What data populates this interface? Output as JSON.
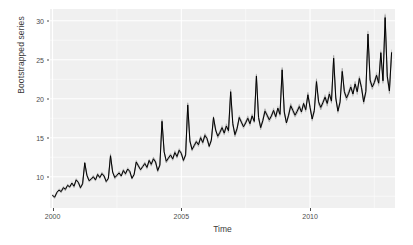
{
  "chart_data": {
    "type": "line",
    "title": "",
    "subtitle": "",
    "xlabel": "Time",
    "ylabel": "Bootstrapped series",
    "xlim": [
      1999.9,
      2013.3
    ],
    "ylim": [
      6.0,
      31.5
    ],
    "grid": true,
    "legend": "none",
    "x_ticks": [
      2000,
      2005,
      2010
    ],
    "x_tick_labels": [
      "2000",
      "2005",
      "2010"
    ],
    "y_ticks": [
      10,
      15,
      20,
      25,
      30
    ],
    "y_tick_labels": [
      "10",
      "15",
      "20",
      "25",
      "30"
    ],
    "x_minor_ticks": [
      2002.5,
      2007.5,
      2012.5
    ],
    "y_minor_ticks": [
      7.5,
      12.5,
      17.5,
      22.5,
      27.5
    ],
    "series": [
      {
        "name": "Bootstrapped series",
        "color": "#000000",
        "x": [
          2000.0,
          2000.083,
          2000.167,
          2000.25,
          2000.333,
          2000.417,
          2000.5,
          2000.583,
          2000.667,
          2000.75,
          2000.833,
          2000.917,
          2001.0,
          2001.083,
          2001.167,
          2001.25,
          2001.333,
          2001.417,
          2001.5,
          2001.583,
          2001.667,
          2001.75,
          2001.833,
          2001.917,
          2002.0,
          2002.083,
          2002.167,
          2002.25,
          2002.333,
          2002.417,
          2002.5,
          2002.583,
          2002.667,
          2002.75,
          2002.833,
          2002.917,
          2003.0,
          2003.083,
          2003.167,
          2003.25,
          2003.333,
          2003.417,
          2003.5,
          2003.583,
          2003.667,
          2003.75,
          2003.833,
          2003.917,
          2004.0,
          2004.083,
          2004.167,
          2004.25,
          2004.333,
          2004.417,
          2004.5,
          2004.583,
          2004.667,
          2004.75,
          2004.833,
          2004.917,
          2005.0,
          2005.083,
          2005.167,
          2005.25,
          2005.333,
          2005.417,
          2005.5,
          2005.583,
          2005.667,
          2005.75,
          2005.833,
          2005.917,
          2006.0,
          2006.083,
          2006.167,
          2006.25,
          2006.333,
          2006.417,
          2006.5,
          2006.583,
          2006.667,
          2006.75,
          2006.833,
          2006.917,
          2007.0,
          2007.083,
          2007.167,
          2007.25,
          2007.333,
          2007.417,
          2007.5,
          2007.583,
          2007.667,
          2007.75,
          2007.833,
          2007.917,
          2008.0,
          2008.083,
          2008.167,
          2008.25,
          2008.333,
          2008.417,
          2008.5,
          2008.583,
          2008.667,
          2008.75,
          2008.833,
          2008.917,
          2009.0,
          2009.083,
          2009.167,
          2009.25,
          2009.333,
          2009.417,
          2009.5,
          2009.583,
          2009.667,
          2009.75,
          2009.833,
          2009.917,
          2010.0,
          2010.083,
          2010.167,
          2010.25,
          2010.333,
          2010.417,
          2010.5,
          2010.583,
          2010.667,
          2010.75,
          2010.833,
          2010.917,
          2011.0,
          2011.083,
          2011.167,
          2011.25,
          2011.333,
          2011.417,
          2011.5,
          2011.583,
          2011.667,
          2011.75,
          2011.833,
          2011.917,
          2012.0,
          2012.083,
          2012.167,
          2012.25,
          2012.333,
          2012.417,
          2012.5,
          2012.583,
          2012.667,
          2012.75,
          2012.833,
          2012.917,
          2013.0,
          2013.083,
          2013.167
        ],
        "values": [
          7.6,
          7.4,
          8.0,
          8.3,
          8.1,
          8.6,
          8.4,
          8.9,
          8.7,
          9.2,
          8.8,
          9.6,
          9.3,
          8.6,
          9.1,
          11.8,
          10.2,
          9.5,
          9.7,
          10.0,
          9.6,
          10.3,
          9.9,
          10.4,
          10.1,
          9.4,
          9.8,
          12.7,
          10.6,
          9.9,
          10.2,
          10.5,
          10.1,
          10.8,
          10.4,
          11.0,
          10.7,
          9.8,
          10.3,
          11.9,
          11.4,
          10.9,
          11.3,
          11.7,
          11.2,
          12.1,
          11.6,
          12.3,
          11.9,
          10.8,
          11.5,
          17.1,
          13.2,
          12.0,
          12.4,
          12.8,
          12.3,
          13.1,
          12.6,
          13.4,
          13.0,
          12.1,
          12.8,
          19.2,
          14.6,
          13.5,
          14.0,
          14.5,
          14.1,
          15.0,
          14.4,
          15.3,
          14.9,
          13.9,
          14.7,
          17.6,
          16.0,
          15.2,
          15.7,
          16.3,
          15.6,
          16.5,
          15.9,
          20.9,
          16.8,
          15.4,
          16.2,
          17.6,
          17.0,
          16.4,
          16.9,
          17.5,
          16.8,
          17.8,
          17.1,
          22.9,
          17.6,
          16.3,
          17.2,
          18.4,
          17.9,
          17.3,
          17.8,
          18.5,
          17.7,
          18.8,
          18.0,
          23.7,
          18.3,
          16.9,
          17.9,
          19.1,
          18.5,
          17.9,
          18.4,
          19.0,
          18.3,
          19.4,
          18.6,
          20.5,
          18.9,
          17.4,
          18.5,
          22.2,
          19.6,
          18.9,
          19.5,
          20.2,
          19.4,
          20.6,
          19.7,
          25.2,
          20.1,
          18.4,
          19.6,
          23.5,
          20.9,
          20.1,
          20.7,
          21.5,
          20.6,
          21.9,
          20.9,
          22.6,
          21.4,
          19.6,
          20.9,
          28.3,
          22.4,
          21.5,
          22.1,
          23.0,
          22.0,
          25.9,
          22.3,
          30.4,
          22.9,
          21.0,
          25.9
        ]
      }
    ],
    "band": {
      "name": "bootstrap replicate envelope",
      "color": "#9a9a9a",
      "opacity": 0.55,
      "half_width_low": 0.18,
      "half_width_high": 0.55,
      "description": "grey envelope of bootstrapped replicates around the black mean series, widening with level"
    }
  },
  "axes": {
    "y_title": "Bootstrapped series",
    "x_title": "Time"
  },
  "theme": {
    "panel_background": "#f0f0f0",
    "major_gridline": "#ffffff",
    "minor_gridline": "#fafafa",
    "line_color": "#000000",
    "band_color": "#9a9a9a",
    "tick_text_color": "#4d4d4d",
    "title_text_color": "#3a3a3a",
    "figure_background": "#ffffff"
  }
}
